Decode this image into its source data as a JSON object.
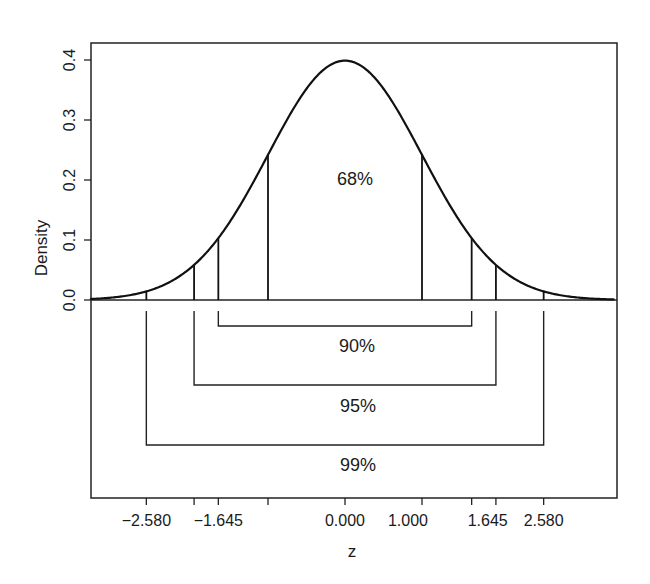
{
  "chart_data": {
    "type": "line",
    "title": "",
    "xlabel": "z",
    "ylabel": "Density",
    "xlim": [
      -3.5,
      3.5
    ],
    "ylim": [
      -0.27,
      0.43
    ],
    "grid": false,
    "legend": null,
    "y_ticks": [
      {
        "value": 0.0,
        "label": "0.0"
      },
      {
        "value": 0.1,
        "label": "0.1"
      },
      {
        "value": 0.2,
        "label": "0.2"
      },
      {
        "value": 0.3,
        "label": "0.3"
      },
      {
        "value": 0.4,
        "label": "0.4"
      }
    ],
    "x_ticks": [
      {
        "value": -2.58,
        "label": "−2.580"
      },
      {
        "value": -1.96,
        "label": ""
      },
      {
        "value": -1.645,
        "label": "−1.645"
      },
      {
        "value": -1.0,
        "label": ""
      },
      {
        "value": 0.0,
        "label": "0.000"
      },
      {
        "value": 1.0,
        "label": "1.000"
      },
      {
        "value": 1.645,
        "label": "1.645"
      },
      {
        "value": 1.96,
        "label": ""
      },
      {
        "value": 2.58,
        "label": "2.580"
      }
    ],
    "series": [
      {
        "name": "Standard normal density",
        "function": "phi(z) = exp(-z^2/2)/sqrt(2*pi)",
        "x": [
          -3.5,
          -3.0,
          -2.58,
          -2.5,
          -2.0,
          -1.96,
          -1.645,
          -1.5,
          -1.0,
          -0.5,
          0.0,
          0.5,
          1.0,
          1.5,
          1.645,
          1.96,
          2.0,
          2.5,
          2.58,
          3.0,
          3.5
        ],
        "y": [
          0.0009,
          0.0044,
          0.0143,
          0.0175,
          0.054,
          0.0584,
          0.1031,
          0.1295,
          0.242,
          0.3521,
          0.3989,
          0.3521,
          0.242,
          0.1295,
          0.1031,
          0.0584,
          0.054,
          0.0175,
          0.0143,
          0.0044,
          0.0009
        ]
      }
    ],
    "vertical_markers": [
      -2.58,
      -1.96,
      -1.645,
      -1.0,
      1.0,
      1.645,
      1.96,
      2.58
    ],
    "annotations": [
      {
        "text": "68%",
        "interval": [
          -1.0,
          1.0
        ],
        "position": "inside curve"
      },
      {
        "text": "90%",
        "interval": [
          -1.645,
          1.645
        ],
        "position": "bracket below axis, level 1"
      },
      {
        "text": "95%",
        "interval": [
          -1.96,
          1.96
        ],
        "position": "bracket below axis, level 2"
      },
      {
        "text": "99%",
        "interval": [
          -2.58,
          2.58
        ],
        "position": "bracket below axis, level 3"
      }
    ]
  }
}
